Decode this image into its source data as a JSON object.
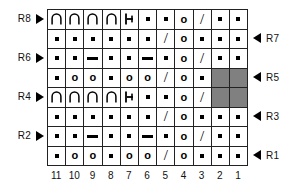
{
  "chart_data": {
    "type": "table",
    "columns": [
      "11",
      "10",
      "9",
      "8",
      "7",
      "6",
      "5",
      "4",
      "3",
      "2",
      "1"
    ],
    "rows": [
      {
        "name": "R8",
        "label_side": "left",
        "cells": [
          {
            "symbol": "arch"
          },
          {
            "symbol": "arch"
          },
          {
            "symbol": "arch"
          },
          {
            "symbol": "arch"
          },
          {
            "symbol": "bar"
          },
          {
            "symbol": "dot"
          },
          {
            "symbol": "dot"
          },
          {
            "symbol": "o"
          },
          {
            "symbol": "slash"
          },
          {
            "symbol": "dot"
          },
          {
            "symbol": "dot"
          }
        ]
      },
      {
        "name": "R7",
        "label_side": "right",
        "cells": [
          {
            "symbol": "dot"
          },
          {
            "symbol": "dot"
          },
          {
            "symbol": "dot"
          },
          {
            "symbol": "dot"
          },
          {
            "symbol": "dot"
          },
          {
            "symbol": "dot"
          },
          {
            "symbol": "slash"
          },
          {
            "symbol": "o"
          },
          {
            "symbol": "dot"
          },
          {
            "symbol": "dot"
          },
          {
            "symbol": "dot"
          }
        ]
      },
      {
        "name": "R6",
        "label_side": "left",
        "cells": [
          {
            "symbol": "dot"
          },
          {
            "symbol": "dot"
          },
          {
            "symbol": "dash"
          },
          {
            "symbol": "dot"
          },
          {
            "symbol": "dot"
          },
          {
            "symbol": "dash"
          },
          {
            "symbol": "dot"
          },
          {
            "symbol": "o"
          },
          {
            "symbol": "slash"
          },
          {
            "symbol": "dot"
          },
          {
            "symbol": "dot"
          }
        ]
      },
      {
        "name": "R5",
        "label_side": "right",
        "cells": [
          {
            "symbol": "dot"
          },
          {
            "symbol": "o"
          },
          {
            "symbol": "o"
          },
          {
            "symbol": "dot"
          },
          {
            "symbol": "o"
          },
          {
            "symbol": "o"
          },
          {
            "symbol": "slash"
          },
          {
            "symbol": "o"
          },
          {
            "symbol": "dot"
          },
          {
            "symbol": "shaded"
          },
          {
            "symbol": "shaded"
          }
        ]
      },
      {
        "name": "R4",
        "label_side": "left",
        "cells": [
          {
            "symbol": "arch"
          },
          {
            "symbol": "arch"
          },
          {
            "symbol": "arch"
          },
          {
            "symbol": "arch"
          },
          {
            "symbol": "bar"
          },
          {
            "symbol": "dot"
          },
          {
            "symbol": "dot"
          },
          {
            "symbol": "o"
          },
          {
            "symbol": "slash"
          },
          {
            "symbol": "shaded"
          },
          {
            "symbol": "shaded"
          }
        ]
      },
      {
        "name": "R3",
        "label_side": "right",
        "cells": [
          {
            "symbol": "dot"
          },
          {
            "symbol": "dot"
          },
          {
            "symbol": "dot"
          },
          {
            "symbol": "dot"
          },
          {
            "symbol": "dot"
          },
          {
            "symbol": "dot"
          },
          {
            "symbol": "slash"
          },
          {
            "symbol": "o"
          },
          {
            "symbol": "dot"
          },
          {
            "symbol": "dot"
          },
          {
            "symbol": "dot"
          }
        ]
      },
      {
        "name": "R2",
        "label_side": "left",
        "cells": [
          {
            "symbol": "dot"
          },
          {
            "symbol": "dot"
          },
          {
            "symbol": "dash"
          },
          {
            "symbol": "dot"
          },
          {
            "symbol": "dot"
          },
          {
            "symbol": "dash"
          },
          {
            "symbol": "dot"
          },
          {
            "symbol": "o"
          },
          {
            "symbol": "slash"
          },
          {
            "symbol": "dot"
          },
          {
            "symbol": "dot"
          }
        ]
      },
      {
        "name": "R1",
        "label_side": "right",
        "cells": [
          {
            "symbol": "dot"
          },
          {
            "symbol": "o"
          },
          {
            "symbol": "o"
          },
          {
            "symbol": "dot"
          },
          {
            "symbol": "o"
          },
          {
            "symbol": "o"
          },
          {
            "symbol": "slash"
          },
          {
            "symbol": "o"
          },
          {
            "symbol": "dot"
          },
          {
            "symbol": "dot"
          },
          {
            "symbol": "dot"
          }
        ]
      }
    ],
    "symbol_glyphs": {
      "o": "o",
      "slash": "/"
    },
    "colors": {
      "shaded_cell": "#808080",
      "grid_line": "#222222",
      "symbol": "#000000",
      "background": "#ffffff"
    },
    "markers": {
      "left_arrow": "right-pointing-triangle",
      "right_arrow": "left-pointing-triangle"
    }
  }
}
